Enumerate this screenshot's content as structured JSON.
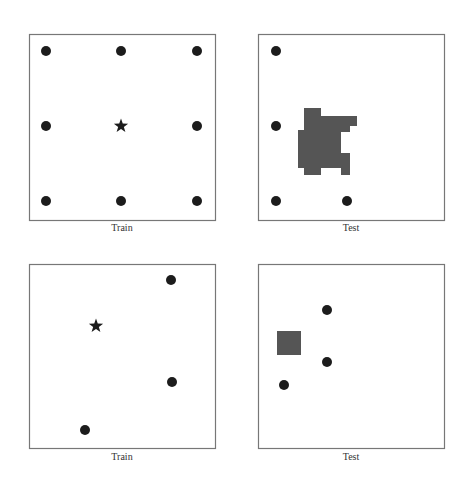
{
  "panels": [
    {
      "id": "top-left",
      "caption": "Train",
      "box": [
        29,
        34,
        186,
        186
      ],
      "dots": [
        [
          46,
          51
        ],
        [
          121,
          51
        ],
        [
          197,
          51
        ],
        [
          46,
          126
        ],
        [
          197,
          126
        ],
        [
          46,
          201
        ],
        [
          121,
          201
        ],
        [
          197,
          201
        ]
      ],
      "stars": [
        [
          121,
          126
        ]
      ],
      "shapes": []
    },
    {
      "id": "top-right",
      "caption": "Test",
      "box": [
        258,
        34,
        186,
        186
      ],
      "dots": [
        [
          276,
          51
        ],
        [
          276,
          126
        ],
        [
          276,
          201
        ],
        [
          347,
          201
        ]
      ],
      "stars": [],
      "shapes": [
        {
          "type": "polygon",
          "points": "304,108 321,108 321,116 357,116 357,126 350,126 350,132 341,132 341,153 350,153 350,175 341,175 341,168 321,168 321,175 304,175 304,168 298,168 298,130 304,130"
        }
      ]
    },
    {
      "id": "bottom-left",
      "caption": "Train",
      "box": [
        29,
        264,
        186,
        184
      ],
      "dots": [
        [
          171,
          280
        ],
        [
          172,
          382
        ],
        [
          85,
          430
        ]
      ],
      "stars": [
        [
          96,
          326
        ]
      ],
      "shapes": []
    },
    {
      "id": "bottom-right",
      "caption": "Test",
      "box": [
        258,
        264,
        186,
        184
      ],
      "dots": [
        [
          327,
          310
        ],
        [
          327,
          362
        ],
        [
          284,
          385
        ]
      ],
      "stars": [],
      "shapes": [
        {
          "type": "rect",
          "x": 277,
          "y": 331,
          "w": 24,
          "h": 24
        }
      ]
    }
  ],
  "colors": {
    "dot": "#1c1c1c",
    "star": "#1c1c1c",
    "shape_fill": "#555555",
    "border": "#777777",
    "caption": "#333333"
  },
  "captions": {
    "top_left": "Train",
    "top_right": "Test",
    "bottom_left": "Train",
    "bottom_right": "Test"
  }
}
